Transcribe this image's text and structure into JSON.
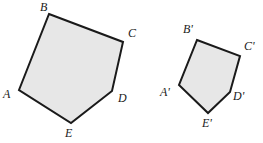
{
  "figure": {
    "width": 263,
    "height": 143,
    "background_color": "#ffffff",
    "fill_color": "#e7e7e7",
    "stroke_color": "#1a1a1a",
    "stroke_width": 2
  },
  "shapes": [
    {
      "name": "pentagon-abcde",
      "label": "ABCDE",
      "points": "49,14 123,42 112,91 71,123 19,90",
      "vertices": [
        {
          "id": "B",
          "label": "B",
          "x": 49,
          "y": 14
        },
        {
          "id": "C",
          "label": "C",
          "x": 123,
          "y": 42
        },
        {
          "id": "D",
          "label": "D",
          "x": 112,
          "y": 91
        },
        {
          "id": "E",
          "label": "E",
          "x": 71,
          "y": 123
        },
        {
          "id": "A",
          "label": "A",
          "x": 19,
          "y": 90
        }
      ]
    },
    {
      "name": "pentagon-abcde-prime",
      "label": "A'B'C'D'E'",
      "points": "197,40 240,56 230,92 208,113 179,85",
      "vertices": [
        {
          "id": "Bp",
          "label": "B'",
          "x": 197,
          "y": 40
        },
        {
          "id": "Cp",
          "label": "C'",
          "x": 240,
          "y": 56
        },
        {
          "id": "Dp",
          "label": "D'",
          "x": 230,
          "y": 92
        },
        {
          "id": "Ep",
          "label": "E'",
          "x": 208,
          "y": 113
        },
        {
          "id": "Ap",
          "label": "A'",
          "x": 179,
          "y": 85
        }
      ]
    }
  ],
  "labels": [
    {
      "name": "label-b",
      "text": "B",
      "left": 40,
      "top": 1
    },
    {
      "name": "label-c",
      "text": "C",
      "left": 128,
      "top": 27
    },
    {
      "name": "label-d",
      "text": "D",
      "left": 118,
      "top": 92
    },
    {
      "name": "label-e",
      "text": "E",
      "left": 65,
      "top": 127
    },
    {
      "name": "label-a",
      "text": "A",
      "left": 3,
      "top": 88
    },
    {
      "name": "label-b-prime",
      "text": "B'",
      "left": 183,
      "top": 23
    },
    {
      "name": "label-c-prime",
      "text": "C'",
      "left": 244,
      "top": 40
    },
    {
      "name": "label-d-prime",
      "text": "D'",
      "left": 233,
      "top": 90
    },
    {
      "name": "label-e-prime",
      "text": "E'",
      "left": 202,
      "top": 117
    },
    {
      "name": "label-a-prime",
      "text": "A'",
      "left": 160,
      "top": 86
    }
  ]
}
